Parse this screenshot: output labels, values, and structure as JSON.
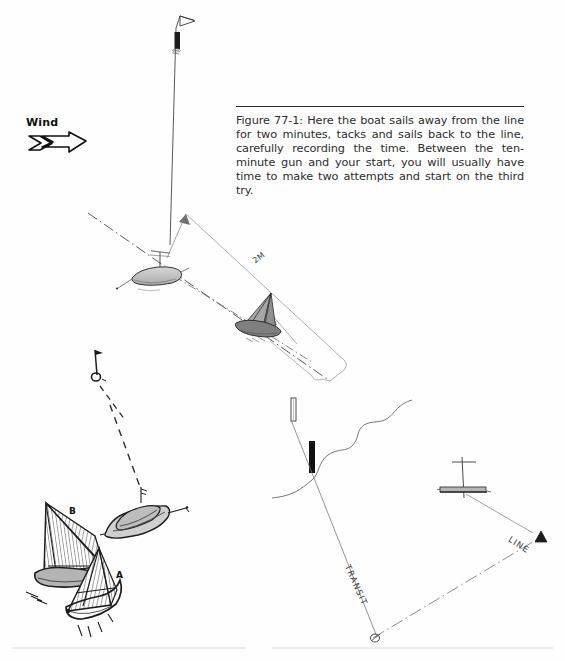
{
  "page": {
    "background_color": "#fefefe",
    "ink_color": "#2b2b2b",
    "width": 565,
    "height": 661
  },
  "caption": {
    "figure_number": "Figure 77-1:",
    "text": "Figure 77-1: Here the boat sails away from the line for two minutes, tacks and sails back to the line, carefully recording the time. Between the ten-minute gun and your start, you will usually have time to make two attempts and start on the third try."
  },
  "wind": {
    "label": "Wind",
    "direction": "right",
    "icon": "wind-arrow-icon"
  },
  "annotations": {
    "distance": "2M",
    "transit": "TRANSIT",
    "line": "LINE",
    "boat_b": "B",
    "boat_a": "A"
  },
  "diagrams": {
    "top": {
      "name": "timed-run-diagram",
      "elements": [
        "windward-mark-flag",
        "committee-boat",
        "start-line-dash-dot",
        "sailboat-sailing-away",
        "distance-dimension-2m",
        "pin-buoy"
      ]
    },
    "bottom_left": {
      "name": "boats-approaching-line-diagram",
      "elements": [
        "sailboat-b",
        "sailboat-a",
        "committee-boat",
        "start-line-dashed"
      ]
    },
    "bottom_right": {
      "name": "transit-sighting-diagram",
      "elements": [
        "shoreline",
        "landmark-white-tower",
        "landmark-black-tower",
        "transit-line",
        "start-line-dash-dot",
        "committee-boat",
        "pin-mark-triangle"
      ]
    }
  },
  "colors": {
    "ink": "#2b2b2b",
    "light_ink": "#6e6e6e",
    "shade": "#9a9a9a",
    "dark_fill": "#111111"
  }
}
